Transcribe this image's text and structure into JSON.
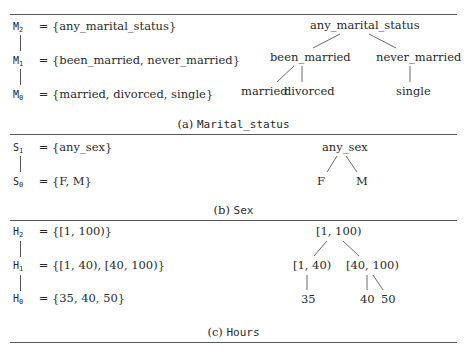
{
  "panels": [
    {
      "caption_prefix": "(a)",
      "caption_name": "Marital_status",
      "levels": [
        {
          "symbol": "M",
          "sub": "2",
          "def": "= {any_marital_status}"
        },
        {
          "symbol": "M",
          "sub": "1",
          "def": "= {been_married, never_married}"
        },
        {
          "symbol": "M",
          "sub": "0",
          "def": "= {married, divorced, single}"
        }
      ],
      "tree": {
        "root": "any_marital_status",
        "mid": [
          "been_married",
          "never_married"
        ],
        "leaves": [
          "married",
          "divorced",
          "single"
        ]
      }
    },
    {
      "caption_prefix": "(b)",
      "caption_name": "Sex",
      "levels": [
        {
          "symbol": "S",
          "sub": "1",
          "def": "= {any_sex}"
        },
        {
          "symbol": "S",
          "sub": "0",
          "def": "= {F, M}"
        }
      ],
      "tree": {
        "root": "any_sex",
        "leaves": [
          "F",
          "M"
        ]
      }
    },
    {
      "caption_prefix": "(c)",
      "caption_name": "Hours",
      "levels": [
        {
          "symbol": "H",
          "sub": "2",
          "def": "= {[1, 100)}"
        },
        {
          "symbol": "H",
          "sub": "1",
          "def": "= {[1, 40), [40, 100)}"
        },
        {
          "symbol": "H",
          "sub": "0",
          "def": "= {35, 40, 50}"
        }
      ],
      "tree": {
        "root": "[1, 100)",
        "mid": [
          "[1, 40)",
          "[40, 100)"
        ],
        "leaves": [
          "35",
          "40",
          "50"
        ]
      }
    }
  ]
}
